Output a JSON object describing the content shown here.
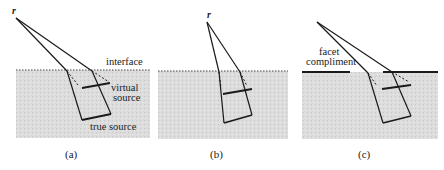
{
  "figure": {
    "panels": [
      {
        "id": "a",
        "caption": "(a)",
        "point_label": "r",
        "labels": {
          "interface": "interface",
          "virtual_source_line1": "virtual",
          "virtual_source_line2": "source",
          "true_source": "true source"
        },
        "boundary": "dotted"
      },
      {
        "id": "b",
        "caption": "(b)",
        "point_label": "r",
        "boundary": "dotted"
      },
      {
        "id": "c",
        "caption": "(c)",
        "labels": {
          "facet_line1": "facet",
          "facet_line2": "compliment"
        },
        "boundary": "solid-facets"
      }
    ],
    "colors": {
      "medium": "#d9d9d9",
      "ink": "#1a1a1a"
    }
  }
}
